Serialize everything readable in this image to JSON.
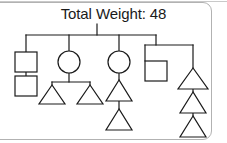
{
  "panel": {
    "title": "Total Weight: 48",
    "border_color": "#b2b2b2",
    "background_color": "#ffffff"
  },
  "diagram": {
    "type": "tree",
    "stroke_color": "#1a1a1a",
    "fill_color": "#ffffff",
    "total_weight": 48,
    "node_shapes": [
      "square",
      "circle",
      "triangle"
    ],
    "node_count": 14,
    "nodes": [
      {
        "id": "root",
        "shape": "junction",
        "label": "",
        "x": 97,
        "y": 35
      },
      {
        "id": "n1",
        "shape": "square",
        "label": "",
        "x": 26,
        "y": 62
      },
      {
        "id": "n2",
        "shape": "square",
        "label": "",
        "x": 26,
        "y": 85
      },
      {
        "id": "n3",
        "shape": "circle",
        "label": "",
        "x": 69,
        "y": 62
      },
      {
        "id": "n4",
        "shape": "triangle",
        "label": "",
        "x": 52,
        "y": 92
      },
      {
        "id": "n5",
        "shape": "triangle",
        "label": "",
        "x": 90,
        "y": 92
      },
      {
        "id": "n6",
        "shape": "circle",
        "label": "",
        "x": 119,
        "y": 62
      },
      {
        "id": "n7",
        "shape": "triangle",
        "label": "",
        "x": 119,
        "y": 92
      },
      {
        "id": "n8",
        "shape": "triangle",
        "label": "",
        "x": 119,
        "y": 121
      },
      {
        "id": "n9",
        "shape": "square",
        "label": "",
        "x": 156,
        "y": 71
      },
      {
        "id": "n10",
        "shape": "triangle",
        "label": "",
        "x": 193,
        "y": 80
      },
      {
        "id": "n11",
        "shape": "triangle",
        "label": "",
        "x": 193,
        "y": 104
      },
      {
        "id": "n12",
        "shape": "triangle",
        "label": "",
        "x": 193,
        "y": 128
      }
    ],
    "edges": [
      {
        "from": "root",
        "to": "n1"
      },
      {
        "from": "root",
        "to": "n3"
      },
      {
        "from": "root",
        "to": "n6"
      },
      {
        "from": "root",
        "to": "n9"
      },
      {
        "from": "n1",
        "to": "n2"
      },
      {
        "from": "n3",
        "to": "n4"
      },
      {
        "from": "n3",
        "to": "n5"
      },
      {
        "from": "n6",
        "to": "n7"
      },
      {
        "from": "n7",
        "to": "n8"
      },
      {
        "from": "n9",
        "to": "n10"
      },
      {
        "from": "n10",
        "to": "n11"
      },
      {
        "from": "n11",
        "to": "n12"
      }
    ]
  }
}
